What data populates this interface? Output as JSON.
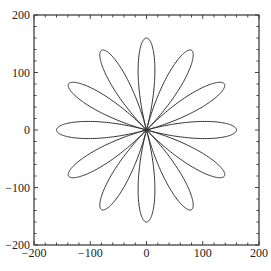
{
  "chart_data": {
    "type": "line",
    "title": "",
    "xlabel": "",
    "ylabel": "",
    "xlim": [
      -200,
      200
    ],
    "ylim": [
      -200,
      200
    ],
    "grid": false,
    "legend": null,
    "x_ticks": [
      -200,
      -100,
      0,
      100,
      200
    ],
    "y_ticks": [
      -200,
      -100,
      0,
      100,
      200
    ],
    "x_tick_labels": [
      "−200",
      "−100",
      "0",
      "100",
      "200"
    ],
    "y_tick_labels": [
      "−200",
      "−100",
      "0",
      "100",
      "200"
    ],
    "minor_tick_step": 20,
    "series": [
      {
        "name": "rose curve",
        "equation": "r = 160 cos(6θ)",
        "petals": 12,
        "amplitude": 160,
        "k": 6,
        "petal_angles_deg": [
          0,
          30,
          60,
          90,
          120,
          150,
          180,
          210,
          240,
          270,
          300,
          330
        ],
        "color": "#333333"
      }
    ]
  },
  "colors": {
    "axis": "#333333",
    "curve": "#333333",
    "background": "#ffffff"
  }
}
